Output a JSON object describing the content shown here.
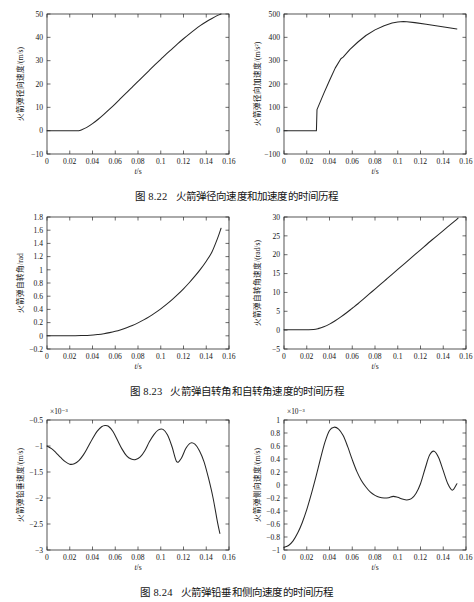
{
  "document": {
    "kind": "textbook-figure-page",
    "background": "#ffffff",
    "line_color": "#262626",
    "axis_color": "#2b2b2b"
  },
  "figures": [
    {
      "id": "fig-8-22",
      "caption_number": "图 8.22",
      "caption_text": "火箭弹径向速度和加速度的时间历程"
    },
    {
      "id": "fig-8-23",
      "caption_number": "图 8.23",
      "caption_text": "火箭弹自转角和自转角速度的时间历程"
    },
    {
      "id": "fig-8-24",
      "caption_number": "图 8.24",
      "caption_text": "火箭弹铅垂和侧向速度的时间历程"
    }
  ],
  "chart_data": [
    {
      "id": "chart-radial-velocity",
      "type": "line",
      "title": "",
      "xlabel": "t/s",
      "ylabel": "火箭弹径向速度/(m/s)",
      "xlim": [
        0,
        0.16
      ],
      "ylim": [
        -10,
        50
      ],
      "xticks": [
        0,
        0.02,
        0.04,
        0.06,
        0.08,
        0.1,
        0.12,
        0.14,
        0.16
      ],
      "xticklabels": [
        "0",
        "0.02",
        "0.04",
        "0.06",
        "0.08",
        "0.1",
        "0.12",
        "0.14",
        "0.16"
      ],
      "yticks": [
        -10,
        0,
        10,
        20,
        30,
        40,
        50
      ],
      "yticklabels": [
        "-10",
        "0",
        "10",
        "20",
        "30",
        "40",
        "50"
      ],
      "y_exponent": "",
      "grid": false,
      "legend": "none",
      "series": [
        {
          "name": "径向速度",
          "x": [
            0,
            0.005,
            0.01,
            0.015,
            0.02,
            0.025,
            0.028,
            0.03,
            0.035,
            0.04,
            0.045,
            0.05,
            0.055,
            0.06,
            0.065,
            0.07,
            0.075,
            0.08,
            0.085,
            0.09,
            0.095,
            0.1,
            0.105,
            0.11,
            0.115,
            0.12,
            0.125,
            0.13,
            0.135,
            0.14,
            0.145,
            0.15,
            0.153
          ],
          "y": [
            0,
            0,
            0,
            0,
            0,
            0,
            0,
            0.3,
            1.4,
            3.0,
            4.9,
            7.0,
            9.2,
            11.5,
            13.9,
            16.3,
            18.7,
            21.1,
            23.5,
            25.9,
            28.3,
            30.6,
            32.9,
            35.1,
            37.3,
            39.4,
            41.4,
            43.3,
            45.1,
            46.7,
            48.1,
            49.4,
            50.0
          ]
        }
      ]
    },
    {
      "id": "chart-radial-acceleration",
      "type": "line",
      "title": "",
      "xlabel": "t/s",
      "ylabel": "火箭弹径向加速度/(m/s²)",
      "xlim": [
        0,
        0.16
      ],
      "ylim": [
        -100,
        500
      ],
      "xticks": [
        0,
        0.02,
        0.04,
        0.06,
        0.08,
        0.1,
        0.12,
        0.14,
        0.16
      ],
      "xticklabels": [
        "0",
        "0.02",
        "0.04",
        "0.06",
        "0.08",
        "0.1",
        "0.12",
        "0.14",
        "0.16"
      ],
      "yticks": [
        -100,
        0,
        100,
        200,
        300,
        400,
        500
      ],
      "yticklabels": [
        "-100",
        "0",
        "100",
        "200",
        "300",
        "400",
        "500"
      ],
      "y_exponent": "",
      "grid": false,
      "legend": "none",
      "series": [
        {
          "name": "径向加速度",
          "x": [
            0,
            0.01,
            0.02,
            0.0285,
            0.029,
            0.035,
            0.04,
            0.045,
            0.05,
            0.052,
            0.058,
            0.065,
            0.072,
            0.08,
            0.088,
            0.095,
            0.1,
            0.105,
            0.108,
            0.115,
            0.125,
            0.135,
            0.145,
            0.152
          ],
          "y": [
            0,
            0,
            0,
            0,
            90,
            160,
            215,
            268,
            308,
            315,
            348,
            380,
            408,
            432,
            450,
            461,
            466,
            468,
            467,
            463,
            456,
            449,
            441,
            436
          ]
        }
      ]
    },
    {
      "id": "chart-spin-angle",
      "type": "line",
      "title": "",
      "xlabel": "t/s",
      "ylabel": "火箭弹自转角/rad",
      "xlim": [
        0,
        0.16
      ],
      "ylim": [
        -0.2,
        1.8
      ],
      "xticks": [
        0,
        0.02,
        0.04,
        0.06,
        0.08,
        0.1,
        0.12,
        0.14,
        0.16
      ],
      "xticklabels": [
        "0",
        "0.02",
        "0.04",
        "0.06",
        "0.08",
        "0.1",
        "0.12",
        "0.14",
        "0.16"
      ],
      "yticks": [
        -0.2,
        0,
        0.2,
        0.4,
        0.6,
        0.8,
        1,
        1.2,
        1.4,
        1.6,
        1.8
      ],
      "yticklabels": [
        "-0.2",
        "0",
        "0.2",
        "0.4",
        "0.6",
        "0.8",
        "1",
        "1.2",
        "1.4",
        "1.6",
        "1.8"
      ],
      "y_exponent": "",
      "grid": false,
      "legend": "none",
      "series": [
        {
          "name": "自转角",
          "x": [
            0,
            0.01,
            0.02,
            0.03,
            0.038,
            0.045,
            0.05,
            0.055,
            0.06,
            0.065,
            0.07,
            0.075,
            0.08,
            0.085,
            0.09,
            0.095,
            0.1,
            0.105,
            0.11,
            0.115,
            0.12,
            0.125,
            0.13,
            0.135,
            0.14,
            0.145,
            0.15,
            0.153
          ],
          "y": [
            0,
            0,
            0,
            0.003,
            0.008,
            0.02,
            0.032,
            0.048,
            0.068,
            0.093,
            0.122,
            0.156,
            0.196,
            0.241,
            0.291,
            0.347,
            0.408,
            0.475,
            0.548,
            0.627,
            0.712,
            0.804,
            0.903,
            1.01,
            1.13,
            1.27,
            1.48,
            1.63
          ]
        }
      ]
    },
    {
      "id": "chart-spin-rate",
      "type": "line",
      "title": "",
      "xlabel": "t/s",
      "ylabel": "火箭弹自转角速度/(rad/s)",
      "xlim": [
        0,
        0.16
      ],
      "ylim": [
        -5,
        30
      ],
      "xticks": [
        0,
        0.02,
        0.04,
        0.06,
        0.08,
        0.1,
        0.12,
        0.14,
        0.16
      ],
      "xticklabels": [
        "0",
        "0.02",
        "0.04",
        "0.06",
        "0.08",
        "0.1",
        "0.12",
        "0.14",
        "0.16"
      ],
      "yticks": [
        -5,
        0,
        5,
        10,
        15,
        20,
        25,
        30
      ],
      "yticklabels": [
        "-5",
        "0",
        "5",
        "10",
        "15",
        "20",
        "25",
        "30"
      ],
      "y_exponent": "",
      "grid": false,
      "legend": "none",
      "series": [
        {
          "name": "自转角速度",
          "x": [
            0,
            0.01,
            0.02,
            0.026,
            0.03,
            0.035,
            0.04,
            0.045,
            0.05,
            0.055,
            0.06,
            0.065,
            0.07,
            0.075,
            0.08,
            0.085,
            0.09,
            0.095,
            0.1,
            0.11,
            0.12,
            0.13,
            0.14,
            0.15,
            0.153
          ],
          "y": [
            0.1,
            0.1,
            0.1,
            0.15,
            0.4,
            0.9,
            1.6,
            2.5,
            3.5,
            4.6,
            5.8,
            7.0,
            8.3,
            9.6,
            10.9,
            12.2,
            13.5,
            14.8,
            16.1,
            18.7,
            21.3,
            23.9,
            26.4,
            28.9,
            29.7
          ]
        }
      ]
    },
    {
      "id": "chart-vertical-velocity",
      "type": "line",
      "title": "",
      "xlabel": "t/s",
      "ylabel": "火箭弹铅垂速度/(m/s)",
      "xlim": [
        0,
        0.16
      ],
      "ylim": [
        -3,
        -0.5
      ],
      "xticks": [
        0,
        0.02,
        0.04,
        0.06,
        0.08,
        0.1,
        0.12,
        0.14,
        0.16
      ],
      "xticklabels": [
        "0",
        "0.02",
        "0.04",
        "0.06",
        "0.08",
        "0.1",
        "0.12",
        "0.14",
        "0.16"
      ],
      "yticks": [
        -3,
        -2.5,
        -2,
        -1.5,
        -1,
        -0.5
      ],
      "yticklabels": [
        "-3",
        "-2.5",
        "-2",
        "-1.5",
        "-1",
        "-0.5"
      ],
      "y_exponent": "×10⁻³",
      "grid": false,
      "legend": "none",
      "series": [
        {
          "name": "铅垂速度",
          "x": [
            0,
            0.004,
            0.008,
            0.012,
            0.016,
            0.02,
            0.024,
            0.028,
            0.032,
            0.036,
            0.04,
            0.044,
            0.048,
            0.051,
            0.054,
            0.058,
            0.062,
            0.066,
            0.07,
            0.074,
            0.078,
            0.082,
            0.086,
            0.09,
            0.094,
            0.098,
            0.102,
            0.106,
            0.11,
            0.114,
            0.118,
            0.122,
            0.126,
            0.13,
            0.134,
            0.138,
            0.142,
            0.146,
            0.15,
            0.152
          ],
          "y": [
            -1.0,
            -1.05,
            -1.13,
            -1.22,
            -1.3,
            -1.35,
            -1.34,
            -1.28,
            -1.17,
            -1.02,
            -0.86,
            -0.72,
            -0.63,
            -0.605,
            -0.62,
            -0.72,
            -0.89,
            -1.06,
            -1.19,
            -1.25,
            -1.26,
            -1.21,
            -1.09,
            -0.92,
            -0.78,
            -0.69,
            -0.68,
            -0.79,
            -1.02,
            -1.3,
            -1.24,
            -1.05,
            -0.945,
            -0.965,
            -1.09,
            -1.3,
            -1.62,
            -2.0,
            -2.48,
            -2.68
          ]
        }
      ]
    },
    {
      "id": "chart-lateral-velocity",
      "type": "line",
      "title": "",
      "xlabel": "t/s",
      "ylabel": "火箭弹侧向速度/(m/s)",
      "xlim": [
        0,
        0.16
      ],
      "ylim": [
        -1,
        1
      ],
      "xticks": [
        0,
        0.02,
        0.04,
        0.06,
        0.08,
        0.1,
        0.12,
        0.14,
        0.16
      ],
      "xticklabels": [
        "0",
        "0.02",
        "0.04",
        "0.06",
        "0.08",
        "0.1",
        "0.12",
        "0.14",
        "0.16"
      ],
      "yticks": [
        -1,
        -0.8,
        -0.6,
        -0.4,
        -0.2,
        0,
        0.2,
        0.4,
        0.6,
        0.8,
        1
      ],
      "yticklabels": [
        "-1",
        "-0.8",
        "-0.6",
        "-0.4",
        "-0.2",
        "0",
        "0.2",
        "0.4",
        "0.6",
        "0.8",
        "1"
      ],
      "y_exponent": "×10⁻³",
      "grid": false,
      "legend": "none",
      "series": [
        {
          "name": "侧向速度",
          "x": [
            0,
            0.004,
            0.008,
            0.012,
            0.016,
            0.02,
            0.024,
            0.028,
            0.032,
            0.036,
            0.04,
            0.044,
            0.048,
            0.052,
            0.056,
            0.06,
            0.064,
            0.068,
            0.072,
            0.076,
            0.08,
            0.084,
            0.088,
            0.092,
            0.096,
            0.1,
            0.104,
            0.108,
            0.112,
            0.116,
            0.12,
            0.124,
            0.128,
            0.132,
            0.136,
            0.14,
            0.144,
            0.148,
            0.152
          ],
          "y": [
            -0.96,
            -0.93,
            -0.86,
            -0.74,
            -0.58,
            -0.38,
            -0.14,
            0.12,
            0.4,
            0.66,
            0.84,
            0.89,
            0.86,
            0.76,
            0.59,
            0.39,
            0.21,
            0.07,
            -0.03,
            -0.11,
            -0.16,
            -0.19,
            -0.2,
            -0.195,
            -0.175,
            -0.19,
            -0.215,
            -0.23,
            -0.21,
            -0.13,
            0.02,
            0.25,
            0.46,
            0.52,
            0.42,
            0.22,
            0.02,
            -0.08,
            0.02
          ]
        }
      ]
    }
  ]
}
